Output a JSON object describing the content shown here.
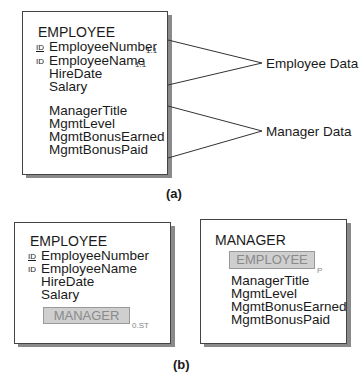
{
  "diagram_a": {
    "entity": {
      "title": "EMPLOYEE",
      "attributes": [
        {
          "id_marker": "ID",
          "name": "EmployeeNumber",
          "cardinality": "1.1"
        },
        {
          "id_marker": "ID",
          "name": "EmployeeName",
          "cardinality": "1.1"
        },
        {
          "id_marker": "",
          "name": "HireDate",
          "cardinality": ""
        },
        {
          "id_marker": "",
          "name": "Salary",
          "cardinality": ""
        },
        {
          "id_marker": "",
          "name": "ManagerTitle",
          "cardinality": ""
        },
        {
          "id_marker": "",
          "name": "MgmtLevel",
          "cardinality": ""
        },
        {
          "id_marker": "",
          "name": "MgmtBonusEarned",
          "cardinality": ""
        },
        {
          "id_marker": "",
          "name": "MgmtBonusPaid",
          "cardinality": ""
        }
      ]
    },
    "annotations": {
      "employee_data": "Employee Data",
      "manager_data": "Manager Data"
    },
    "caption": "(a)"
  },
  "diagram_b": {
    "employee_entity": {
      "title": "EMPLOYEE",
      "attributes": [
        {
          "id_marker": "ID",
          "name": "EmployeeNumber"
        },
        {
          "id_marker": "ID",
          "name": "EmployeeName"
        },
        {
          "id_marker": "",
          "name": "HireDate"
        },
        {
          "id_marker": "",
          "name": "Salary"
        }
      ],
      "subtype_object": {
        "label": "MANAGER",
        "cardinality": "0.ST"
      }
    },
    "manager_entity": {
      "title": "MANAGER",
      "parent_object": {
        "label": "EMPLOYEE",
        "marker": "P"
      },
      "attributes": [
        {
          "name": "ManagerTitle"
        },
        {
          "name": "MgmtLevel"
        },
        {
          "name": "MgmtBonusEarned"
        },
        {
          "name": "MgmtBonusPaid"
        }
      ]
    },
    "caption": "(b)"
  }
}
